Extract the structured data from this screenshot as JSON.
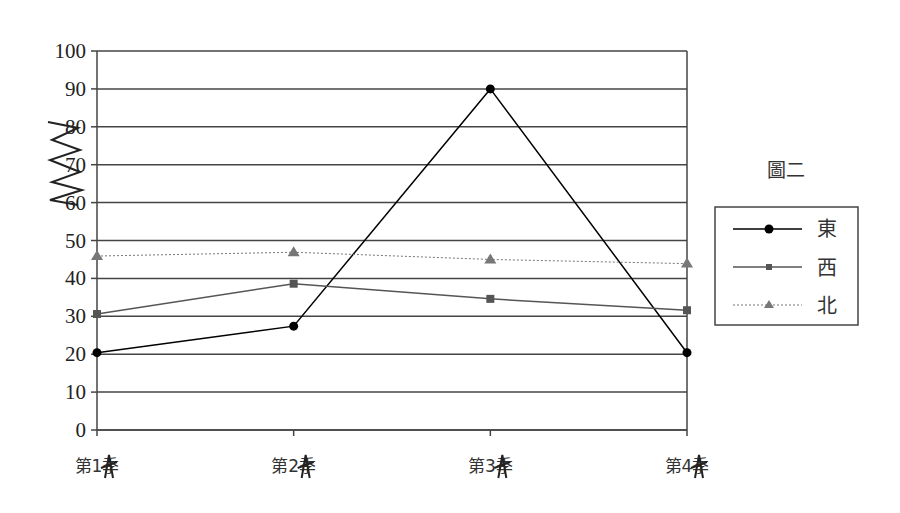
{
  "chart_data": {
    "type": "line",
    "title": "圖二",
    "xlabel": "",
    "ylabel": "",
    "categories": [
      "第1季",
      "第2季",
      "第3季",
      "第4季"
    ],
    "series": [
      {
        "name": "東",
        "values": [
          20.4,
          27.4,
          90,
          20.4
        ],
        "color": "#000000",
        "marker": "circle",
        "line": "solid"
      },
      {
        "name": "西",
        "values": [
          30.6,
          38.6,
          34.6,
          31.6
        ],
        "color": "#555555",
        "marker": "square",
        "line": "solid"
      },
      {
        "name": "北",
        "values": [
          45.9,
          46.9,
          45,
          43.9
        ],
        "color": "#777777",
        "marker": "triangle",
        "line": "dotted"
      }
    ],
    "ylim": [
      0,
      100
    ],
    "yticks": [
      0,
      10,
      20,
      30,
      40,
      50,
      60,
      70,
      80,
      90,
      100
    ],
    "grid": true,
    "legend_position": "right",
    "annotations": [
      "handwritten scribble over y labels 60-80",
      "scribbles over x tick labels"
    ]
  },
  "legend": {
    "title": "圖二",
    "items": [
      {
        "label": "東"
      },
      {
        "label": "西"
      },
      {
        "label": "北"
      }
    ]
  }
}
